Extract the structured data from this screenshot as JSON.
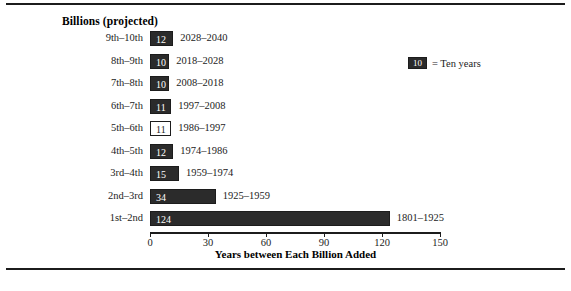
{
  "chart_data": {
    "type": "bar",
    "orientation": "horizontal",
    "title": "Billions (projected)",
    "xlabel": "Years between Each Billion Added",
    "ylabel": "",
    "categories": [
      "1st–2nd",
      "2nd–3rd",
      "3rd–4th",
      "4th–5th",
      "5th–6th",
      "6th–7th",
      "7th–8th",
      "8th–9th",
      "9th–10th"
    ],
    "values": [
      124,
      34,
      15,
      12,
      11,
      11,
      10,
      10,
      12
    ],
    "point_labels": [
      "1801–1925",
      "1925–1959",
      "1959–1974",
      "1974–1986",
      "1986–1997",
      "1997–2008",
      "2008–2018",
      "2018–2028",
      "2028–2040"
    ],
    "projected": [
      false,
      false,
      false,
      false,
      false,
      true,
      true,
      true,
      true
    ],
    "xlim": [
      0,
      150
    ],
    "xticks": [
      0,
      30,
      60,
      90,
      120,
      150
    ],
    "xticklabels": [
      "0",
      "30",
      "60",
      "90",
      "120",
      "150"
    ],
    "grid": false,
    "legend": {
      "position": "top-right",
      "swatch_value": "10",
      "text": "= Ten years"
    },
    "colors": {
      "bar_fill": "#2b2b2b",
      "bar_edge": "#1c1c1c",
      "hollow_fill": "#ffffff",
      "value_text_on_bar": "#ffffff",
      "value_text_on_hollow": "#1c1c1c",
      "axis": "#1c1c1c",
      "background": "#ffffff"
    },
    "rows": [
      {
        "category": "9th–10th",
        "value": 12,
        "label": "12",
        "years": "2028–2040",
        "hollow": false
      },
      {
        "category": "8th–9th",
        "value": 10,
        "label": "10",
        "years": "2018–2028",
        "hollow": false
      },
      {
        "category": "7th–8th",
        "value": 10,
        "label": "10",
        "years": "2008–2018",
        "hollow": false
      },
      {
        "category": "6th–7th",
        "value": 11,
        "label": "11",
        "years": "1997–2008",
        "hollow": false
      },
      {
        "category": "5th–6th",
        "value": 11,
        "label": "11",
        "years": "1986–1997",
        "hollow": true
      },
      {
        "category": "4th–5th",
        "value": 12,
        "label": "12",
        "years": "1974–1986",
        "hollow": false
      },
      {
        "category": "3rd–4th",
        "value": 15,
        "label": "15",
        "years": "1959–1974",
        "hollow": false
      },
      {
        "category": "2nd–3rd",
        "value": 34,
        "label": "34",
        "years": "1925–1959",
        "hollow": false
      },
      {
        "category": "1st–2nd",
        "value": 124,
        "label": "124",
        "years": "1801–1925",
        "hollow": false
      }
    ]
  }
}
